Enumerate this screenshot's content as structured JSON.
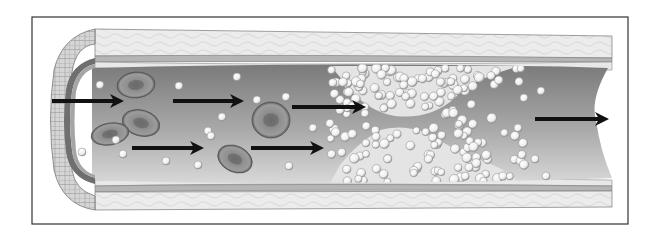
{
  "diagram": {
    "frame": {
      "x": 32,
      "y": 17,
      "w": 596,
      "h": 207,
      "stroke": "#333333"
    },
    "colors": {
      "wall_light": "#e6e6e6",
      "wall_mid": "#c9c9c9",
      "wall_dark": "#8f8f8f",
      "lumen_dark": "#7d7d7d",
      "lumen_light": "#d2d2d2",
      "red_cell": "#8a8a8a",
      "red_cell_center": "#6e6e6e",
      "platelet": "#f4f4f4",
      "clot": "#e9e9e9",
      "arrow": "#111111"
    },
    "arrows": [
      {
        "x1": 52,
        "y1": 101,
        "x2": 124,
        "y2": 101
      },
      {
        "x1": 173,
        "y1": 101,
        "x2": 244,
        "y2": 101
      },
      {
        "x1": 132,
        "y1": 148,
        "x2": 204,
        "y2": 148
      },
      {
        "x1": 251,
        "y1": 148,
        "x2": 324,
        "y2": 148
      },
      {
        "x1": 292,
        "y1": 107,
        "x2": 366,
        "y2": 107
      },
      {
        "x1": 535,
        "y1": 119,
        "x2": 609,
        "y2": 119
      }
    ],
    "red_cells": [
      {
        "cx": 136,
        "cy": 85,
        "rx": 19,
        "ry": 13,
        "rot": -5
      },
      {
        "cx": 141,
        "cy": 123,
        "rx": 19,
        "ry": 13,
        "rot": 15
      },
      {
        "cx": 110,
        "cy": 134,
        "rx": 19,
        "ry": 11,
        "rot": -10
      },
      {
        "cx": 271,
        "cy": 120,
        "rx": 19,
        "ry": 18,
        "rot": 0
      },
      {
        "cx": 235,
        "cy": 159,
        "rx": 18,
        "ry": 13,
        "rot": 25
      }
    ],
    "free_platelets": [
      [
        100,
        85
      ],
      [
        179,
        86
      ],
      [
        237,
        77
      ],
      [
        257,
        100
      ],
      [
        286,
        97
      ],
      [
        222,
        117
      ],
      [
        208,
        131
      ],
      [
        211,
        136
      ],
      [
        116,
        140
      ],
      [
        82,
        152
      ],
      [
        123,
        154
      ],
      [
        166,
        161
      ],
      [
        198,
        165
      ],
      [
        289,
        166
      ],
      [
        313,
        128
      ],
      [
        518,
        128
      ],
      [
        541,
        91
      ],
      [
        524,
        98
      ],
      [
        535,
        159
      ],
      [
        546,
        176
      ]
    ],
    "flow_direction": "left-to-right"
  }
}
